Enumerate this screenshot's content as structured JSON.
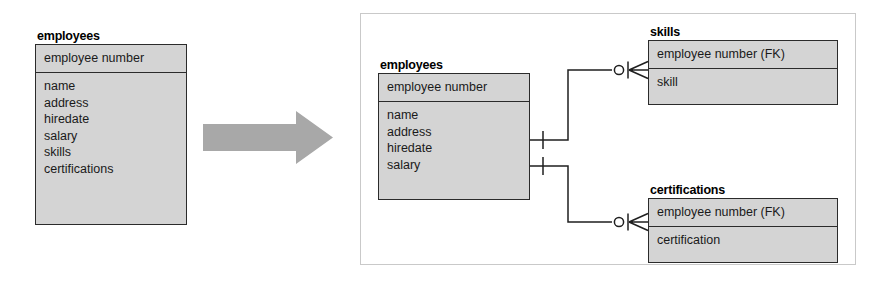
{
  "diagram": {
    "type": "er-diagram",
    "notation": "crow's foot (IE)",
    "title_text": "",
    "colors": {
      "entity_fill": "#d4d4d4",
      "entity_border": "#2b2b2b",
      "panel_border": "#c9c9c9",
      "arrow_fill": "#a8a8a8",
      "line": "#1f1f1f",
      "text": "#1a1a1a",
      "background": "#ffffff"
    }
  },
  "before": {
    "entity": {
      "name": "employees",
      "key_attributes": [
        "employee number"
      ],
      "attributes": [
        "name",
        "address",
        "hiredate",
        "salary",
        "skills",
        "certifications"
      ]
    }
  },
  "transform_arrow": {
    "icon": "right-block-arrow",
    "direction": "right"
  },
  "after": {
    "entities": [
      {
        "id": "employees",
        "name": "employees",
        "key_attributes": [
          "employee number"
        ],
        "attributes": [
          "name",
          "address",
          "hiredate",
          "salary"
        ]
      },
      {
        "id": "skills",
        "name": "skills",
        "key_attributes": [
          "employee number (FK)"
        ],
        "attributes": [
          "skill"
        ]
      },
      {
        "id": "certifications",
        "name": "certifications",
        "key_attributes": [
          "employee number (FK)"
        ],
        "attributes": [
          "certification"
        ]
      }
    ],
    "relationships": [
      {
        "id": "employees-skills",
        "from": "employees",
        "to": "skills",
        "from_cardinality": "exactly one",
        "to_cardinality": "zero or many"
      },
      {
        "id": "employees-certifications",
        "from": "employees",
        "to": "certifications",
        "from_cardinality": "exactly one",
        "to_cardinality": "zero or many"
      }
    ]
  }
}
